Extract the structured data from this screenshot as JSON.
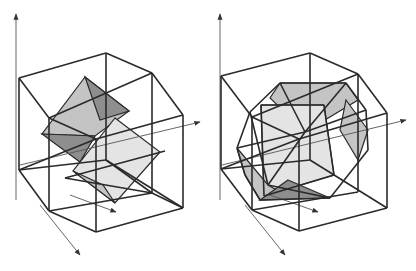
{
  "figure": {
    "colors": {
      "edge": "#2a2a2a",
      "axis": "#555555",
      "face_light": "#e4e4e4",
      "face_mid": "#c4c4c4",
      "face_dark": "#8e8e8e"
    },
    "panels": [
      {
        "id": "left",
        "outer_lines": [
          [
            19,
            78,
            106,
            53
          ],
          [
            106,
            53,
            152,
            73
          ],
          [
            152,
            73,
            183,
            115
          ],
          [
            19,
            78,
            49,
            118
          ],
          [
            49,
            118,
            152,
            73
          ],
          [
            49,
            118,
            49,
            211
          ],
          [
            19,
            78,
            19,
            170
          ],
          [
            19,
            170,
            49,
            211
          ],
          [
            49,
            211,
            96,
            232
          ],
          [
            96,
            232,
            183,
            208
          ],
          [
            183,
            208,
            183,
            115
          ],
          [
            152,
            73,
            152,
            193
          ],
          [
            106,
            53,
            106,
            160
          ],
          [
            106,
            160,
            19,
            170
          ],
          [
            106,
            160,
            183,
            208
          ],
          [
            106,
            160,
            152,
            193
          ],
          [
            152,
            193,
            183,
            208
          ],
          [
            49,
            118,
            96,
            139
          ],
          [
            96,
            139,
            183,
            115
          ],
          [
            96,
            139,
            96,
            232
          ],
          [
            19,
            170,
            96,
            139
          ],
          [
            49,
            211,
            152,
            193
          ],
          [
            65,
            178,
            152,
            193
          ],
          [
            65,
            178,
            165,
            151
          ]
        ],
        "faces": [
          {
            "points": "85,77 129,111 95,136 42,134",
            "fill": "face_mid"
          },
          {
            "points": "85,77 129,111 100,120",
            "fill": "face_dark"
          },
          {
            "points": "42,134 95,136 80,162",
            "fill": "face_dark"
          },
          {
            "points": "115,118 160,152 115,203 73,171",
            "fill": "face_light"
          },
          {
            "points": "73,171 115,203 103,185",
            "fill": "face_mid"
          }
        ],
        "axes": [
          [
            16,
            200,
            16,
            14
          ],
          [
            40,
            205,
            80,
            255
          ],
          [
            70,
            195,
            116,
            212
          ],
          [
            20,
            165,
            200,
            122
          ]
        ]
      },
      {
        "id": "right",
        "outer_lines": [
          [
            221,
            76,
            310,
            53
          ],
          [
            310,
            53,
            358,
            74
          ],
          [
            358,
            74,
            387,
            113
          ],
          [
            221,
            76,
            252,
            117
          ],
          [
            252,
            117,
            358,
            74
          ],
          [
            252,
            117,
            252,
            210
          ],
          [
            221,
            76,
            221,
            169
          ],
          [
            221,
            169,
            252,
            210
          ],
          [
            252,
            210,
            299,
            231
          ],
          [
            299,
            231,
            387,
            208
          ],
          [
            387,
            208,
            387,
            113
          ],
          [
            358,
            74,
            358,
            192
          ],
          [
            310,
            53,
            310,
            160
          ],
          [
            310,
            160,
            221,
            169
          ],
          [
            310,
            160,
            387,
            208
          ],
          [
            299,
            139,
            387,
            113
          ],
          [
            252,
            117,
            299,
            139
          ],
          [
            299,
            139,
            299,
            231
          ],
          [
            221,
            169,
            299,
            139
          ],
          [
            252,
            210,
            358,
            192
          ]
        ],
        "faces": [
          {
            "points": "280,83 346,83 358,100 305,132 270,98",
            "fill": "face_mid"
          },
          {
            "points": "261,105 324,105 334,175 264,196",
            "fill": "face_light"
          },
          {
            "points": "237,148 268,185 290,198 260,200 245,175",
            "fill": "face_mid"
          },
          {
            "points": "288,180 330,198 260,200",
            "fill": "face_dark"
          },
          {
            "points": "346,100 368,130 358,160 340,130",
            "fill": "face_mid"
          }
        ],
        "polyhedron_edges": [
          [
            280,
            83,
            346,
            83
          ],
          [
            346,
            83,
            366,
            110
          ],
          [
            366,
            110,
            368,
            150
          ],
          [
            368,
            150,
            330,
            198
          ],
          [
            330,
            198,
            260,
            200
          ],
          [
            260,
            200,
            245,
            175
          ],
          [
            245,
            175,
            237,
            148
          ],
          [
            237,
            148,
            250,
            112
          ],
          [
            250,
            112,
            280,
            83
          ],
          [
            261,
            105,
            324,
            105
          ],
          [
            324,
            105,
            334,
            175
          ],
          [
            334,
            175,
            264,
            196
          ],
          [
            264,
            196,
            261,
            105
          ],
          [
            280,
            83,
            305,
            132
          ],
          [
            305,
            132,
            346,
            83
          ],
          [
            237,
            148,
            305,
            132
          ],
          [
            305,
            132,
            366,
            110
          ],
          [
            305,
            132,
            268,
            185
          ],
          [
            268,
            185,
            330,
            198
          ],
          [
            250,
            112,
            268,
            185
          ]
        ],
        "axes": [
          [
            220,
            200,
            220,
            14
          ],
          [
            245,
            205,
            285,
            255
          ],
          [
            270,
            195,
            318,
            212
          ],
          [
            222,
            165,
            406,
            120
          ]
        ]
      }
    ]
  }
}
